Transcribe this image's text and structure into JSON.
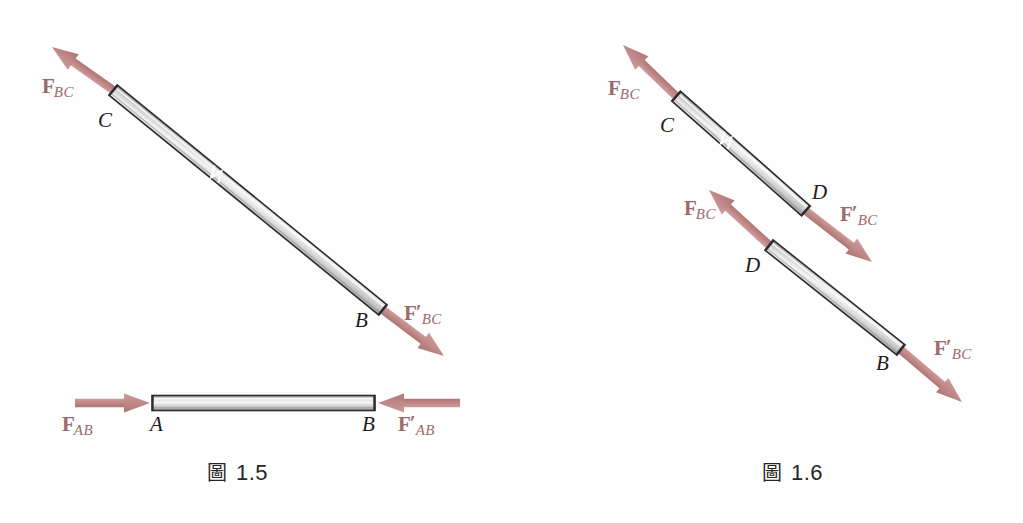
{
  "page": {
    "width": 1023,
    "height": 523,
    "background": "#fefefe",
    "kind": "mechanics-diagram"
  },
  "palette": {
    "arrow_fill": "#c08a8a",
    "arrow_shade": "#b37878",
    "force_label_color": "#9c6a6a",
    "point_label_color": "#1c1c1c",
    "rod_outline": "#2b2b2b",
    "rod_light": "#f2f2f2",
    "rod_mid": "#c9c9c9",
    "rod_dark": "#9a9a9a",
    "caption_color": "#262626"
  },
  "figures": [
    {
      "id": "figure-1-5",
      "caption": {
        "mark": "圖",
        "number": "1.5"
      },
      "description": "Two-force member BC in tension with collinear forces at C and B, and member AB in compression.",
      "members": [
        {
          "name": "member-bc",
          "endpoints": [
            {
              "label": "C",
              "x": 113,
              "y": 90
            },
            {
              "label": "B",
              "x": 383,
              "y": 310
            }
          ],
          "orientation": "diagonal",
          "width": 13,
          "has_seam": true
        },
        {
          "name": "member-ab",
          "endpoints": [
            {
              "label": "A",
              "x": 152,
              "y": 403
            },
            {
              "label": "B",
              "x": 375,
              "y": 403
            }
          ],
          "orientation": "horizontal",
          "width": 15,
          "has_seam": false
        }
      ],
      "forces": [
        {
          "name": "force-bc-at-c",
          "label_main": "F",
          "prime": false,
          "subscript": "BC",
          "tail": {
            "x": 113,
            "y": 90
          },
          "tip": {
            "x": 52,
            "y": 47
          },
          "label_x": 42,
          "label_y": 76
        },
        {
          "name": "force-bc-prime-at-b",
          "label_main": "F",
          "prime": true,
          "subscript": "BC",
          "tail": {
            "x": 383,
            "y": 310
          },
          "tip": {
            "x": 444,
            "y": 356
          },
          "label_x": 404,
          "label_y": 303
        },
        {
          "name": "force-ab-at-a",
          "label_main": "F",
          "prime": false,
          "subscript": "AB",
          "tail": {
            "x": 75,
            "y": 403
          },
          "tip": {
            "x": 150,
            "y": 403
          },
          "label_x": 62,
          "label_y": 414
        },
        {
          "name": "force-ab-prime-at-b",
          "label_main": "F",
          "prime": true,
          "subscript": "AB",
          "tail": {
            "x": 460,
            "y": 403
          },
          "tip": {
            "x": 378,
            "y": 403
          },
          "label_x": 398,
          "label_y": 414
        }
      ],
      "point_labels": [
        {
          "name": "point-c",
          "text": "C",
          "x": 98,
          "y": 110
        },
        {
          "name": "point-b-diagonal",
          "text": "B",
          "x": 355,
          "y": 310
        },
        {
          "name": "point-a",
          "text": "A",
          "x": 150,
          "y": 414
        },
        {
          "name": "point-b-horizontal",
          "text": "B",
          "x": 362,
          "y": 414
        }
      ]
    },
    {
      "id": "figure-1-6",
      "caption": {
        "mark": "圖",
        "number": "1.6"
      },
      "description": "Member BC sectioned at D into two free bodies, showing equal and opposite internal forces at the cut.",
      "members": [
        {
          "name": "segment-cd",
          "endpoints": [
            {
              "label": "C",
              "x": 676,
              "y": 96
            },
            {
              "label": "D",
              "x": 806,
              "y": 211
            }
          ],
          "orientation": "diagonal",
          "width": 13,
          "has_seam": true
        },
        {
          "name": "segment-db",
          "endpoints": [
            {
              "label": "D",
              "x": 769,
              "y": 245
            },
            {
              "label": "B",
              "x": 901,
              "y": 350
            }
          ],
          "orientation": "diagonal",
          "width": 13,
          "has_seam": false
        }
      ],
      "forces": [
        {
          "name": "force-bc-at-c",
          "label_main": "F",
          "prime": false,
          "subscript": "BC",
          "tail": {
            "x": 676,
            "y": 96
          },
          "tip": {
            "x": 623,
            "y": 45
          },
          "label_x": 608,
          "label_y": 78
        },
        {
          "name": "force-bc-prime-at-d-upper",
          "label_main": "F",
          "prime": true,
          "subscript": "BC",
          "tail": {
            "x": 806,
            "y": 211
          },
          "tip": {
            "x": 872,
            "y": 262
          },
          "label_x": 840,
          "label_y": 204
        },
        {
          "name": "force-bc-at-d-lower",
          "label_main": "F",
          "prime": false,
          "subscript": "BC",
          "tail": {
            "x": 769,
            "y": 245
          },
          "tip": {
            "x": 709,
            "y": 190
          },
          "label_x": 684,
          "label_y": 198
        },
        {
          "name": "force-bc-prime-at-b",
          "label_main": "F",
          "prime": true,
          "subscript": "BC",
          "tail": {
            "x": 901,
            "y": 350
          },
          "tip": {
            "x": 962,
            "y": 402
          },
          "label_x": 934,
          "label_y": 338
        }
      ],
      "point_labels": [
        {
          "name": "point-c",
          "text": "C",
          "x": 660,
          "y": 115
        },
        {
          "name": "point-d-upper",
          "text": "D",
          "x": 812,
          "y": 182
        },
        {
          "name": "point-d-lower",
          "text": "D",
          "x": 745,
          "y": 255
        },
        {
          "name": "point-b",
          "text": "B",
          "x": 876,
          "y": 353
        }
      ]
    }
  ]
}
